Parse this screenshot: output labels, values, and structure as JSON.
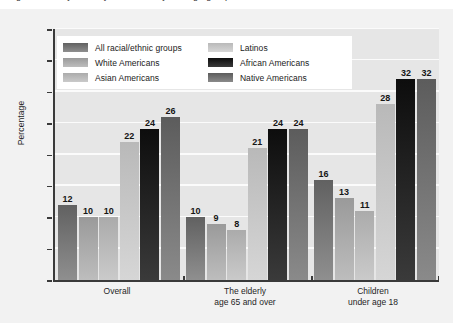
{
  "figure": {
    "title_sliver": "Figure: Poverty rates by race/ethnicity and age group",
    "ylabel": "Percentage"
  },
  "chart_data": {
    "type": "bar",
    "title": "",
    "xlabel": "",
    "ylabel": "Percentage",
    "ylim": [
      0,
      40
    ],
    "yticks": [
      "0%",
      "5%",
      "10%",
      "15%",
      "20%",
      "25%",
      "30%",
      "35%",
      "40%"
    ],
    "ytick_values": [
      0,
      5,
      10,
      15,
      20,
      25,
      30,
      35,
      40
    ],
    "grid": true,
    "legend_position": "upper-left-inside",
    "categories": [
      "Overall",
      "The elderly\nage 65 and over",
      "Children\nunder age 18"
    ],
    "category_lines": [
      [
        "Overall"
      ],
      [
        "The elderly",
        "age 65 and over"
      ],
      [
        "Children",
        "under age 18"
      ]
    ],
    "series": [
      {
        "name": "All racial/ethnic groups",
        "color": "#6b6b6b",
        "values": [
          12,
          10,
          16
        ]
      },
      {
        "name": "White Americans",
        "color": "#a5a5a5",
        "values": [
          10,
          9,
          13
        ]
      },
      {
        "name": "Asian Americans",
        "color": "#b7b7b7",
        "values": [
          10,
          8,
          11
        ]
      },
      {
        "name": "Latinos",
        "color": "#c6c6c6",
        "values": [
          22,
          21,
          28
        ]
      },
      {
        "name": "African Americans",
        "color": "#141414",
        "values": [
          24,
          24,
          32
        ]
      },
      {
        "name": "Native Americans",
        "color": "#666666",
        "values": [
          26,
          24,
          32
        ]
      }
    ],
    "value_labels": [
      [
        12,
        10,
        10,
        22,
        24,
        26
      ],
      [
        10,
        9,
        8,
        21,
        24,
        24
      ],
      [
        16,
        13,
        11,
        28,
        32,
        32
      ]
    ]
  },
  "legend": {
    "left_column": [
      {
        "label": "All racial/ethnic groups",
        "swatch": "s0"
      },
      {
        "label": "White Americans",
        "swatch": "s1"
      },
      {
        "label": "Asian Americans",
        "swatch": "s2"
      }
    ],
    "right_column": [
      {
        "label": "Latinos",
        "swatch": "s3"
      },
      {
        "label": "African Americans",
        "swatch": "s4"
      },
      {
        "label": "Native Americans",
        "swatch": "s5"
      }
    ]
  }
}
